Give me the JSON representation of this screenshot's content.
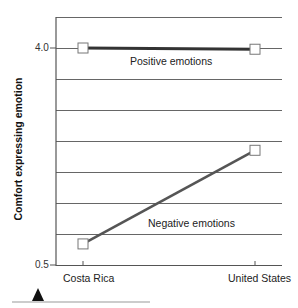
{
  "chart_data": {
    "type": "line",
    "title": "",
    "xlabel": "",
    "ylabel": "Comfort expressing emotion",
    "categories": [
      "Costa Rica",
      "United States"
    ],
    "series": [
      {
        "name": "Positive emotions",
        "values": [
          4.0,
          3.98
        ],
        "color": "#333333"
      },
      {
        "name": "Negative emotions",
        "values": [
          0.84,
          2.35
        ],
        "color": "#555555"
      }
    ],
    "ylim": [
      0.5,
      4.5
    ],
    "yticks_labeled": [
      "4.0",
      "0.5"
    ],
    "grid": true,
    "gridline_step": 0.5,
    "legend": "inline labels",
    "marker": "open-square"
  },
  "labels": {
    "ylabel": "Comfort expressing emotion",
    "ytick_top": "4.0",
    "ytick_bottom": "0.5",
    "positive": "Positive emotions",
    "negative": "Negative emotions",
    "cat1": "Costa Rica",
    "cat2": "United States"
  }
}
